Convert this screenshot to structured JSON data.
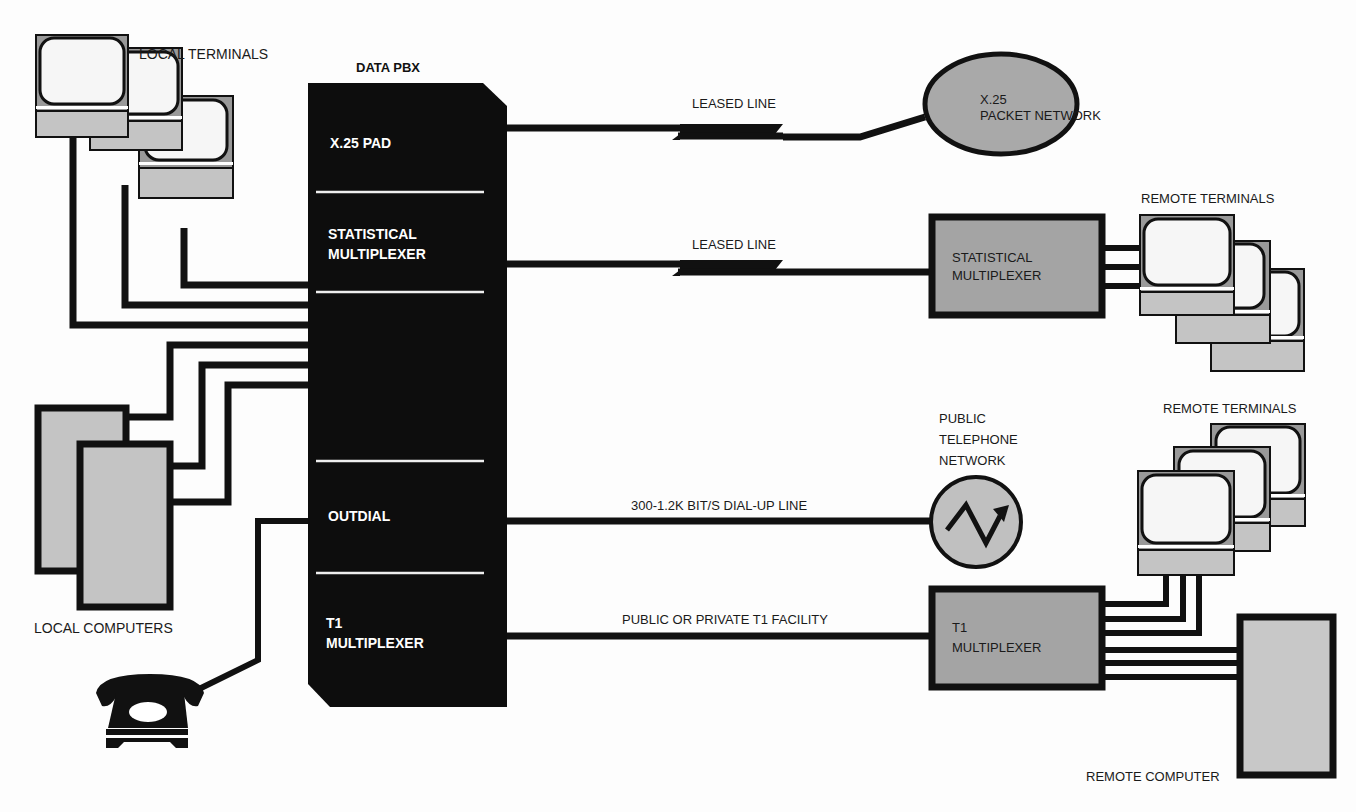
{
  "diagram": {
    "title": "DATA PBX",
    "pbx_sections": [
      {
        "label_lines": [
          "X.25 PAD"
        ]
      },
      {
        "label_lines": [
          "STATISTICAL",
          "MULTIPLEXER"
        ]
      },
      {
        "label_lines": [
          ""
        ]
      },
      {
        "label_lines": [
          "OUTDIAL"
        ]
      },
      {
        "label_lines": [
          "T1",
          "MULTIPLEXER"
        ]
      }
    ],
    "left": {
      "local_terminals": "LOCAL TERMINALS",
      "local_computers": "LOCAL COMPUTERS"
    },
    "links": [
      {
        "label": "LEASED LINE",
        "type": "leased"
      },
      {
        "label": "LEASED LINE",
        "type": "leased"
      },
      {
        "label": "300-1.2K BIT/S DIAL-UP LINE",
        "type": "dialup"
      },
      {
        "label": "PUBLIC OR PRIVATE T1 FACILITY",
        "type": "t1"
      }
    ],
    "right": {
      "x25_network": [
        "X.25",
        "PACKET NETWORK"
      ],
      "remote_stat_mux": [
        "STATISTICAL",
        "MULTIPLEXER"
      ],
      "remote_terminals_1": "REMOTE TERMINALS",
      "phone_network": [
        "PUBLIC",
        "TELEPHONE",
        "NETWORK"
      ],
      "remote_terminals_2": "REMOTE TERMINALS",
      "remote_t1_mux": [
        "T1",
        "MULTIPLEXER"
      ],
      "remote_computer": "REMOTE COMPUTER"
    },
    "colors": {
      "ink": "#111111",
      "gray_fill": "#a9a9a9",
      "light_gray_fill": "#c4c4c4",
      "background": "#fdfdfd"
    }
  }
}
